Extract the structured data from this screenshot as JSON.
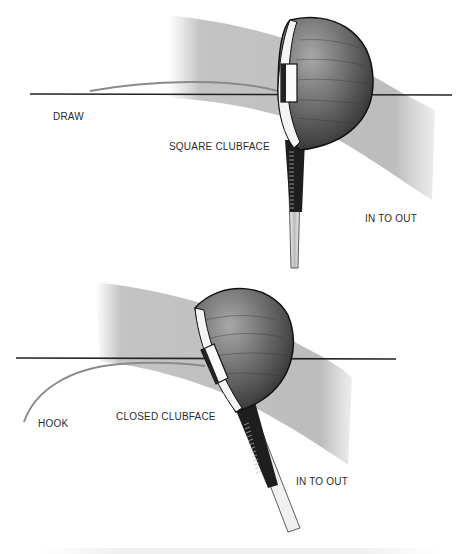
{
  "figure": {
    "panels": [
      {
        "id": "draw",
        "shot_shape_label": "DRAW",
        "clubface_label": "SQUARE CLUBFACE",
        "swing_path_label": "IN TO OUT"
      },
      {
        "id": "hook",
        "shot_shape_label": "HOOK",
        "clubface_label": "CLOSED CLUBFACE",
        "swing_path_label": "IN TO OUT"
      }
    ],
    "colors": {
      "background": "#ffffff",
      "target_line": "#222222",
      "ball_flight": "#8a8a8a",
      "swing_band": "#b8b8b8",
      "clubhead": "#5a5a5a",
      "label_text": "#2a2a2a"
    }
  }
}
